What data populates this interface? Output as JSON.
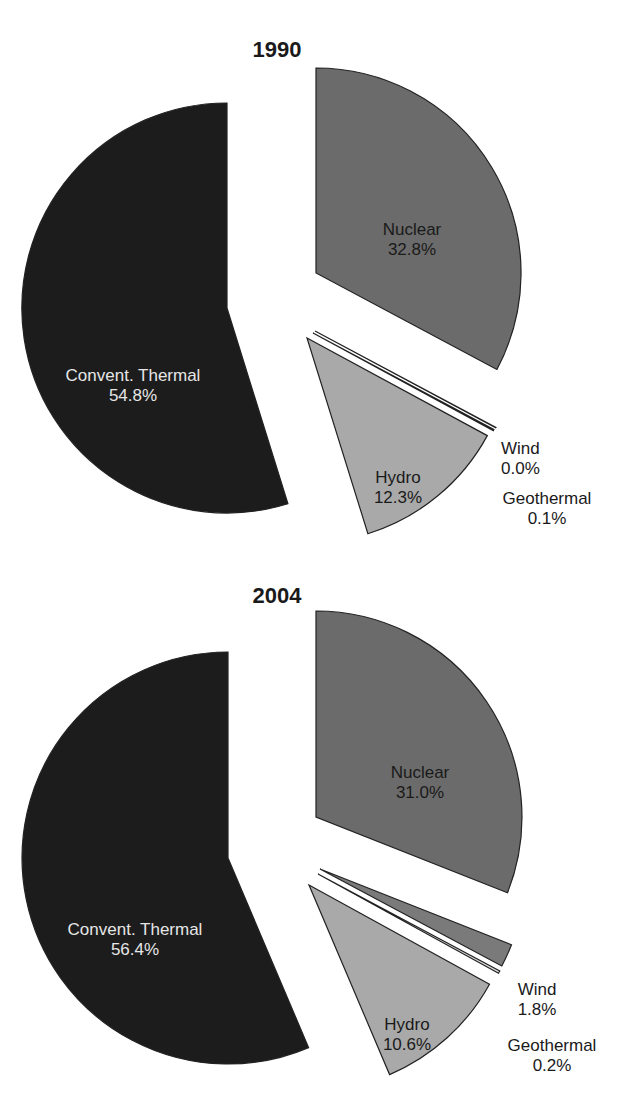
{
  "chart_data": [
    {
      "type": "pie",
      "title": "1990",
      "exploded": true,
      "start_angle": "12 o'clock, clockwise",
      "slices": [
        {
          "label": "Nuclear",
          "value": 32.8,
          "display": "32.8%",
          "color": "#6b6b6b",
          "text_color": "#1a1a1a"
        },
        {
          "label": "Wind",
          "value": 0.0,
          "display": "0.0%",
          "color": "#7a7a7a",
          "text_color": "#1a1a1a"
        },
        {
          "label": "Geothermal",
          "value": 0.1,
          "display": "0.1%",
          "color": "#d8d8d8",
          "text_color": "#1a1a1a"
        },
        {
          "label": "Hydro",
          "value": 12.3,
          "display": "12.3%",
          "color": "#a9a9a9",
          "text_color": "#1a1a1a"
        },
        {
          "label": "Convent. Thermal",
          "value": 54.8,
          "display": "54.8%",
          "color": "#1c1c1c",
          "text_color": "#e6e6e6"
        }
      ]
    },
    {
      "type": "pie",
      "title": "2004",
      "exploded": true,
      "start_angle": "12 o'clock, clockwise",
      "slices": [
        {
          "label": "Nuclear",
          "value": 31.0,
          "display": "31.0%",
          "color": "#6b6b6b",
          "text_color": "#1a1a1a"
        },
        {
          "label": "Wind",
          "value": 1.8,
          "display": "1.8%",
          "color": "#7a7a7a",
          "text_color": "#1a1a1a"
        },
        {
          "label": "Geothermal",
          "value": 0.2,
          "display": "0.2%",
          "color": "#d8d8d8",
          "text_color": "#1a1a1a"
        },
        {
          "label": "Hydro",
          "value": 10.6,
          "display": "10.6%",
          "color": "#a9a9a9",
          "text_color": "#1a1a1a"
        },
        {
          "label": "Convent. Thermal",
          "value": 56.4,
          "display": "56.4%",
          "color": "#1c1c1c",
          "text_color": "#e6e6e6"
        }
      ]
    }
  ]
}
